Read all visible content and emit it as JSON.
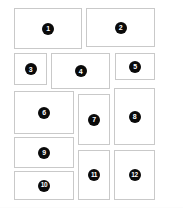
{
  "page": {
    "background_color": "#ffffff",
    "width": 183,
    "height": 217
  },
  "style": {
    "card_background": "#ffffff",
    "card_border_color": "#c9c9c9",
    "badge_background": "#0a0a0a",
    "badge_text_color": "#ffffff"
  },
  "cards": [
    {
      "label": "1",
      "x": 14,
      "y": 8,
      "w": 68,
      "h": 41
    },
    {
      "label": "2",
      "x": 86,
      "y": 8,
      "w": 69,
      "h": 39
    },
    {
      "label": "3",
      "x": 14,
      "y": 53,
      "w": 33,
      "h": 32
    },
    {
      "label": "4",
      "x": 51,
      "y": 53,
      "w": 59,
      "h": 36
    },
    {
      "label": "5",
      "x": 115,
      "y": 53,
      "w": 40,
      "h": 27
    },
    {
      "label": "6",
      "x": 14,
      "y": 91,
      "w": 60,
      "h": 43
    },
    {
      "label": "7",
      "x": 78,
      "y": 94,
      "w": 32,
      "h": 51
    },
    {
      "label": "8",
      "x": 114,
      "y": 88,
      "w": 41,
      "h": 57
    },
    {
      "label": "9",
      "x": 14,
      "y": 137,
      "w": 60,
      "h": 31
    },
    {
      "label": "10",
      "x": 14,
      "y": 171,
      "w": 60,
      "h": 29
    },
    {
      "label": "11",
      "x": 78,
      "y": 150,
      "w": 32,
      "h": 50
    },
    {
      "label": "12",
      "x": 114,
      "y": 150,
      "w": 41,
      "h": 50
    }
  ]
}
